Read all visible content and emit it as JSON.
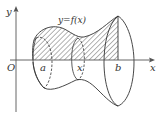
{
  "diagram": {
    "curve_label": "y=f(x)",
    "axes": {
      "x_label": "x",
      "y_label": "y",
      "origin_label": "O"
    },
    "points": [
      {
        "name": "a",
        "label": "a"
      },
      {
        "name": "x",
        "label": "x"
      },
      {
        "name": "b",
        "label": "b"
      }
    ],
    "colors": {
      "stroke": "#333333",
      "axis": "#555555",
      "background": "#ffffff"
    }
  }
}
